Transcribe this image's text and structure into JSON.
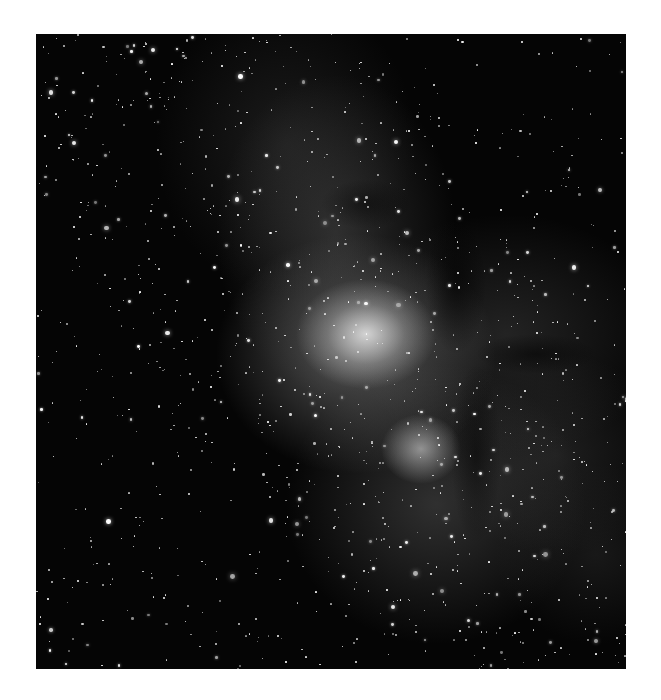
{
  "image": {
    "subject": "Milky Way galactic center star field",
    "style": "grayscale astrophotograph",
    "frame": {
      "left": 36,
      "top": 34,
      "width": 590,
      "height": 635
    },
    "background_color": "#050505",
    "page_background": "#ffffff",
    "features": [
      {
        "name": "bright-core",
        "x": 330,
        "y": 300
      },
      {
        "name": "secondary-cloud",
        "x": 385,
        "y": 415
      },
      {
        "name": "dark-dust-lanes",
        "x": 440,
        "y": 300
      }
    ]
  }
}
